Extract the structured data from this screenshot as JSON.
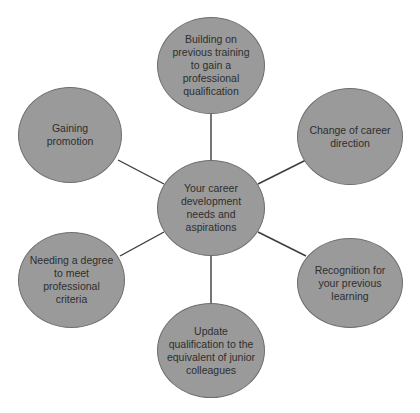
{
  "diagram": {
    "type": "hub-and-spoke",
    "colors": {
      "node_fill": "#9a9a9a",
      "node_border": "#6e6e6e",
      "text": "#2e2e2e",
      "connector": "#3a3a3a",
      "background": "#ffffff"
    },
    "center": {
      "label": "Your career\ndevelopment\nneeds and\naspirations"
    },
    "nodes": [
      {
        "id": "top",
        "label": "Building on\nprevious training\nto gain a\nprofessional\nqualification"
      },
      {
        "id": "upper-right",
        "label": "Change of career\ndirection"
      },
      {
        "id": "lower-right",
        "label": "Recognition for\nyour previous\nlearning"
      },
      {
        "id": "bottom",
        "label": "Update\nqualification to the\nequivalent of junior\ncolleagues"
      },
      {
        "id": "lower-left",
        "label": "Needing a degree\nto meet\nprofessional\ncriteria"
      },
      {
        "id": "upper-left",
        "label": "Gaining\npromotion"
      }
    ]
  }
}
